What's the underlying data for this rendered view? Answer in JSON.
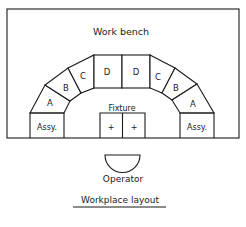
{
  "bench": {
    "label": "Work bench"
  },
  "segments": {
    "left_a": "A",
    "left_b": "B",
    "left_c": "C",
    "left_d": "D",
    "right_d": "D",
    "right_c": "C",
    "right_b": "B",
    "right_a": "A"
  },
  "assembly": {
    "left_label": "Assy.",
    "right_label": "Assy."
  },
  "fixture": {
    "label": "Fixture",
    "left_mark": "+",
    "right_mark": "+"
  },
  "operator": {
    "label": "Operator"
  },
  "caption": "Workplace layout"
}
